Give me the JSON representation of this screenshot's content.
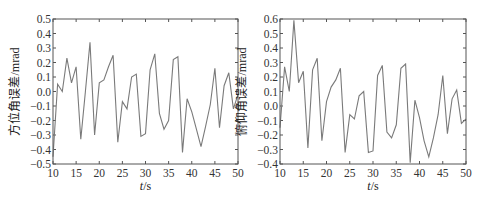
{
  "chart_data": [
    {
      "type": "line",
      "title": "",
      "xlabel": "t/s",
      "ylabel": "方位角误差/mrad",
      "xlim": [
        10,
        50
      ],
      "ylim": [
        -0.5,
        0.5
      ],
      "xticks": [
        10,
        15,
        20,
        25,
        30,
        35,
        40,
        45,
        50
      ],
      "yticks": [
        -0.5,
        -0.4,
        -0.3,
        -0.2,
        -0.1,
        0.0,
        0.1,
        0.2,
        0.3,
        0.4,
        0.5
      ],
      "ytick_labels": [
        "−0.5",
        "−0.4",
        "−0.3",
        "−0.2",
        "−0.1",
        "0.0",
        "0.1",
        "0.2",
        "0.3",
        "0.4",
        "0.5"
      ],
      "grid": false,
      "legend": null,
      "color": "#7a7a7a",
      "x": [
        10,
        11,
        12,
        13,
        14,
        15,
        16,
        17,
        18,
        19,
        20,
        21,
        22,
        23,
        24,
        25,
        26,
        27,
        28,
        29,
        30,
        31,
        32,
        33,
        34,
        35,
        36,
        37,
        38,
        39,
        40,
        41,
        42,
        43,
        44,
        45,
        46,
        47,
        48,
        49,
        50
      ],
      "values": [
        -0.45,
        0.05,
        0.0,
        0.23,
        0.06,
        0.17,
        -0.33,
        0.0,
        0.34,
        -0.3,
        0.06,
        0.08,
        0.17,
        0.25,
        -0.35,
        -0.07,
        -0.12,
        0.1,
        0.12,
        -0.31,
        -0.29,
        0.15,
        0.26,
        -0.15,
        -0.26,
        -0.2,
        0.22,
        0.24,
        -0.42,
        -0.05,
        -0.14,
        -0.26,
        -0.38,
        -0.24,
        -0.09,
        0.16,
        -0.25,
        0.04,
        0.13,
        -0.12,
        -0.02
      ]
    },
    {
      "type": "line",
      "title": "",
      "xlabel": "t/s",
      "ylabel": "俯仰角误差/mrad",
      "xlim": [
        10,
        50
      ],
      "ylim": [
        -0.4,
        0.6
      ],
      "xticks": [
        10,
        15,
        20,
        25,
        30,
        35,
        40,
        45,
        50
      ],
      "yticks": [
        -0.4,
        -0.3,
        -0.2,
        -0.1,
        0.0,
        0.1,
        0.2,
        0.3,
        0.4,
        0.5,
        0.6
      ],
      "ytick_labels": [
        "−0.4",
        "−0.3",
        "−0.2",
        "−0.1",
        "0.0",
        "0.1",
        "0.2",
        "0.3",
        "0.4",
        "0.5",
        "0.6"
      ],
      "grid": false,
      "legend": null,
      "color": "#7a7a7a",
      "x": [
        10,
        11,
        12,
        13,
        14,
        15,
        16,
        17,
        18,
        19,
        20,
        21,
        22,
        23,
        24,
        25,
        26,
        27,
        28,
        29,
        30,
        31,
        32,
        33,
        34,
        35,
        36,
        37,
        38,
        39,
        40,
        41,
        42,
        43,
        44,
        45,
        46,
        47,
        48,
        49,
        50
      ],
      "values": [
        -0.15,
        0.27,
        0.1,
        0.59,
        0.16,
        0.24,
        -0.29,
        0.25,
        0.33,
        -0.24,
        0.03,
        0.13,
        0.18,
        0.26,
        -0.32,
        -0.06,
        -0.09,
        0.07,
        0.1,
        -0.32,
        -0.31,
        0.21,
        0.28,
        -0.18,
        -0.22,
        -0.13,
        0.26,
        0.29,
        -0.39,
        0.04,
        -0.08,
        -0.24,
        -0.35,
        -0.22,
        -0.06,
        0.21,
        -0.19,
        0.05,
        0.11,
        -0.12,
        -0.09
      ]
    }
  ],
  "panels": [
    {
      "ylabel": "方位角误差/mrad",
      "xlabel_italic": "t",
      "xlabel_unit": "/s"
    },
    {
      "ylabel": "俯仰角误差/mrad",
      "xlabel_italic": "t",
      "xlabel_unit": "/s"
    }
  ]
}
